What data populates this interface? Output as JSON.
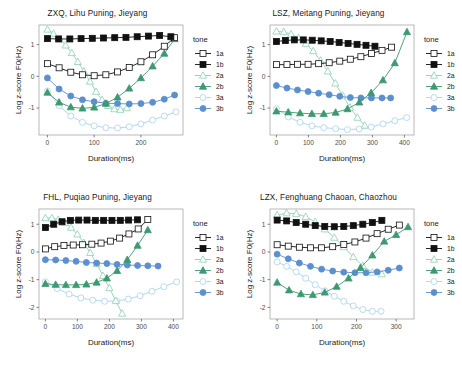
{
  "figure": {
    "axis_labels": {
      "x": "Duration(ms)",
      "y": "Log z-score F0(Hz)"
    },
    "legend_title": "tone",
    "series_colors": {
      "1a": "#111111",
      "1b": "#111111",
      "2a": "#8fd0b0",
      "2b": "#3d9970",
      "3a": "#a9d2ec",
      "3b": "#5b8fd0"
    },
    "series_markers": {
      "1a": "open-square",
      "1b": "filled-square",
      "2a": "open-triangle",
      "2b": "filled-triangle",
      "3a": "open-circle",
      "3b": "filled-circle"
    },
    "legend_entries": [
      "1a",
      "1b",
      "2a",
      "2b",
      "3a",
      "3b"
    ]
  },
  "chart_data": [
    {
      "type": "line",
      "panel": 1,
      "title": "ZXQ, Lihu Puning, Jieyang",
      "xlabel": "Duration(ms)",
      "ylabel": "Log z-score F0(Hz)",
      "xlim": [
        -18,
        290
      ],
      "ylim": [
        -1.85,
        1.62
      ],
      "xticks": [
        0,
        100,
        200
      ],
      "yticks": [
        1,
        0,
        -1
      ],
      "grid": false,
      "legend_position": "right",
      "series": [
        {
          "name": "1a",
          "x": [
            0,
            25,
            50,
            75,
            100,
            125,
            150,
            175,
            200,
            225,
            250,
            272
          ],
          "values": [
            0.4,
            0.27,
            0.13,
            0.05,
            0.02,
            0.05,
            0.14,
            0.28,
            0.46,
            0.68,
            0.95,
            1.22
          ]
        },
        {
          "name": "1b",
          "x": [
            0,
            24,
            48,
            72,
            96,
            120,
            144,
            168,
            192,
            216,
            240,
            264
          ],
          "values": [
            1.19,
            1.18,
            1.18,
            1.19,
            1.2,
            1.21,
            1.22,
            1.23,
            1.25,
            1.27,
            1.29,
            1.25
          ]
        },
        {
          "name": "2a",
          "x": [
            0,
            13,
            26,
            39,
            52,
            65,
            78,
            91,
            104,
            117,
            130,
            143,
            156,
            170
          ],
          "values": [
            1.48,
            1.35,
            1.18,
            0.98,
            0.74,
            0.46,
            0.16,
            -0.16,
            -0.48,
            -0.74,
            -0.93,
            -1.03,
            -1.05,
            -1.0
          ]
        },
        {
          "name": "2b",
          "x": [
            0,
            25,
            50,
            75,
            100,
            125,
            150,
            175,
            200,
            225,
            250,
            272
          ],
          "values": [
            -0.51,
            -0.82,
            -0.97,
            -1.01,
            -0.98,
            -0.86,
            -0.66,
            -0.38,
            -0.05,
            0.32,
            0.72,
            1.18
          ]
        },
        {
          "name": "3a",
          "x": [
            0,
            25,
            50,
            75,
            100,
            125,
            150,
            175,
            200,
            225,
            250,
            275
          ],
          "values": [
            -0.46,
            -0.93,
            -1.25,
            -1.45,
            -1.56,
            -1.62,
            -1.63,
            -1.59,
            -1.5,
            -1.38,
            -1.25,
            -1.12
          ]
        },
        {
          "name": "3b",
          "x": [
            0,
            25,
            50,
            75,
            100,
            125,
            150,
            175,
            200,
            225,
            250,
            272
          ],
          "values": [
            -0.05,
            -0.4,
            -0.62,
            -0.74,
            -0.8,
            -0.85,
            -0.86,
            -0.87,
            -0.86,
            -0.82,
            -0.72,
            -0.59
          ]
        }
      ]
    },
    {
      "type": "line",
      "panel": 2,
      "title": "LSZ, Meitang Puning, Jieyang",
      "xlabel": "Duration(ms)",
      "ylabel": "Log z-score F0(Hz)",
      "xlim": [
        -20,
        430
      ],
      "ylim": [
        -1.85,
        1.62
      ],
      "xticks": [
        0,
        100,
        200,
        300,
        400
      ],
      "yticks": [
        1,
        0,
        -1
      ],
      "grid": false,
      "legend_position": "right",
      "series": [
        {
          "name": "1a",
          "x": [
            0,
            33,
            66,
            99,
            132,
            165,
            198,
            231,
            264,
            297,
            330,
            360
          ],
          "values": [
            0.37,
            0.37,
            0.38,
            0.38,
            0.4,
            0.43,
            0.48,
            0.54,
            0.62,
            0.72,
            0.82,
            0.92
          ]
        },
        {
          "name": "1b",
          "x": [
            0,
            28,
            56,
            84,
            112,
            140,
            168,
            196,
            224,
            252,
            280,
            308
          ],
          "values": [
            1.1,
            1.13,
            1.15,
            1.15,
            1.14,
            1.12,
            1.1,
            1.07,
            1.04,
            1.01,
            0.98,
            0.95
          ]
        },
        {
          "name": "2a",
          "x": [
            0,
            23,
            46,
            69,
            92,
            115,
            138,
            161,
            184,
            207,
            230,
            253,
            276
          ],
          "values": [
            1.42,
            1.4,
            1.33,
            1.21,
            1.03,
            0.8,
            0.5,
            0.16,
            -0.22,
            -0.6,
            -0.98,
            -1.3,
            -1.55
          ]
        },
        {
          "name": "2b",
          "x": [
            0,
            37,
            74,
            111,
            148,
            185,
            222,
            259,
            296,
            333,
            370,
            408
          ],
          "values": [
            -1.1,
            -1.13,
            -1.16,
            -1.18,
            -1.18,
            -1.14,
            -1.03,
            -0.82,
            -0.52,
            -0.12,
            0.42,
            1.4
          ]
        },
        {
          "name": "3a",
          "x": [
            0,
            37,
            74,
            111,
            148,
            185,
            222,
            259,
            296,
            333,
            370,
            407
          ],
          "values": [
            -1.02,
            -1.28,
            -1.45,
            -1.56,
            -1.62,
            -1.65,
            -1.68,
            -1.66,
            -1.6,
            -1.5,
            -1.4,
            -1.3
          ]
        },
        {
          "name": "3b",
          "x": [
            0,
            33,
            66,
            99,
            132,
            165,
            198,
            231,
            264,
            297,
            330,
            357
          ],
          "values": [
            -0.29,
            -0.37,
            -0.43,
            -0.48,
            -0.53,
            -0.58,
            -0.63,
            -0.67,
            -0.68,
            -0.68,
            -0.68,
            -0.68
          ]
        }
      ]
    },
    {
      "type": "line",
      "panel": 3,
      "title": "FHL, Puqiao Puning, Jieyang",
      "xlabel": "Duration(ms)",
      "ylabel": "Log z-score F0(Hz)",
      "xlim": [
        -20,
        430
      ],
      "ylim": [
        -2.42,
        1.55
      ],
      "xticks": [
        0,
        100,
        200,
        300,
        400
      ],
      "yticks": [
        1,
        0,
        -1,
        -2
      ],
      "grid": false,
      "legend_position": "right",
      "series": [
        {
          "name": "1a",
          "x": [
            0,
            29,
            58,
            87,
            116,
            145,
            174,
            203,
            232,
            261,
            290,
            320
          ],
          "values": [
            0.11,
            0.19,
            0.23,
            0.25,
            0.26,
            0.28,
            0.32,
            0.39,
            0.5,
            0.65,
            0.83,
            1.17
          ]
        },
        {
          "name": "1b",
          "x": [
            0,
            26,
            52,
            78,
            104,
            130,
            156,
            182,
            208,
            234,
            260,
            288
          ],
          "values": [
            0.88,
            1.0,
            1.09,
            1.14,
            1.15,
            1.15,
            1.14,
            1.14,
            1.14,
            1.14,
            1.15,
            1.16
          ]
        },
        {
          "name": "2a",
          "x": [
            0,
            20,
            40,
            60,
            80,
            100,
            120,
            140,
            160,
            180,
            200,
            220,
            240
          ],
          "values": [
            1.23,
            1.22,
            1.17,
            1.06,
            0.88,
            0.64,
            0.33,
            -0.03,
            -0.43,
            -0.86,
            -1.3,
            -1.76,
            -2.22
          ]
        },
        {
          "name": "2b",
          "x": [
            0,
            32,
            64,
            96,
            128,
            160,
            192,
            224,
            256,
            288,
            320
          ],
          "values": [
            -1.15,
            -1.18,
            -1.19,
            -1.19,
            -1.17,
            -1.1,
            -0.95,
            -0.68,
            -0.28,
            0.23,
            0.79
          ]
        },
        {
          "name": "3a",
          "x": [
            0,
            37,
            74,
            111,
            148,
            185,
            222,
            259,
            296,
            333,
            370,
            410
          ],
          "values": [
            -1.08,
            -1.32,
            -1.52,
            -1.66,
            -1.74,
            -1.78,
            -1.77,
            -1.7,
            -1.58,
            -1.42,
            -1.25,
            -1.08
          ]
        },
        {
          "name": "3b",
          "x": [
            0,
            32,
            64,
            96,
            128,
            160,
            192,
            224,
            256,
            288,
            320,
            352
          ],
          "values": [
            -0.28,
            -0.29,
            -0.31,
            -0.34,
            -0.38,
            -0.4,
            -0.42,
            -0.45,
            -0.47,
            -0.49,
            -0.5,
            -0.51
          ]
        }
      ]
    },
    {
      "type": "line",
      "panel": 4,
      "title": "LZX, Fenghuang Chaoan, Chaozhou",
      "xlabel": "Duration(ms)",
      "ylabel": "Log z-score F0(Hz)",
      "xlim": [
        -18,
        345
      ],
      "ylim": [
        -2.42,
        1.55
      ],
      "xticks": [
        0,
        100,
        200,
        300
      ],
      "yticks": [
        1,
        0,
        -1,
        -2
      ],
      "grid": false,
      "legend_position": "right",
      "series": [
        {
          "name": "1a",
          "x": [
            0,
            28,
            56,
            84,
            112,
            140,
            168,
            196,
            224,
            252,
            280,
            308
          ],
          "values": [
            0.26,
            0.21,
            0.17,
            0.15,
            0.15,
            0.19,
            0.27,
            0.36,
            0.5,
            0.66,
            0.82,
            0.97
          ]
        },
        {
          "name": "1b",
          "x": [
            0,
            24,
            48,
            72,
            96,
            120,
            144,
            168,
            192,
            216,
            240,
            264
          ],
          "values": [
            1.15,
            1.12,
            1.06,
            1.0,
            0.95,
            0.92,
            0.91,
            0.92,
            0.95,
            1.0,
            1.06,
            1.14
          ]
        },
        {
          "name": "2a",
          "x": [
            0,
            24,
            48,
            72,
            96,
            120,
            144,
            168,
            192,
            216,
            240,
            264
          ],
          "values": [
            1.33,
            1.4,
            1.38,
            1.27,
            1.08,
            0.82,
            0.52,
            0.18,
            -0.18,
            -0.5,
            -0.74,
            -0.8
          ]
        },
        {
          "name": "2b",
          "x": [
            0,
            30,
            60,
            90,
            120,
            150,
            180,
            210,
            240,
            270,
            300,
            330
          ],
          "values": [
            -1.1,
            -1.38,
            -1.52,
            -1.55,
            -1.46,
            -1.25,
            -0.95,
            -0.57,
            -0.12,
            0.38,
            0.62,
            0.9
          ]
        },
        {
          "name": "3a",
          "x": [
            0,
            24,
            48,
            72,
            96,
            120,
            144,
            168,
            192,
            216,
            240,
            262
          ],
          "values": [
            -0.36,
            -0.52,
            -0.72,
            -0.95,
            -1.18,
            -1.4,
            -1.6,
            -1.78,
            -1.95,
            -2.08,
            -2.14,
            -2.14
          ]
        },
        {
          "name": "3b",
          "x": [
            0,
            28,
            56,
            84,
            112,
            140,
            168,
            196,
            224,
            252,
            280,
            308
          ],
          "values": [
            -0.08,
            -0.25,
            -0.4,
            -0.52,
            -0.62,
            -0.69,
            -0.73,
            -0.75,
            -0.75,
            -0.72,
            -0.66,
            -0.58
          ]
        }
      ]
    }
  ]
}
